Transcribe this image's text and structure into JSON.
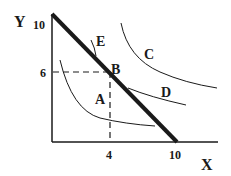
{
  "axes": {
    "x_label": "X",
    "y_label": "Y",
    "x_ticks": [
      "4",
      "10"
    ],
    "y_ticks": [
      "10",
      "6"
    ]
  },
  "curves": {
    "A": "A",
    "B": "B",
    "C": "C",
    "D": "D",
    "E": "E"
  },
  "colors": {
    "line": "#1a1a1a",
    "background": "#ffffff"
  }
}
